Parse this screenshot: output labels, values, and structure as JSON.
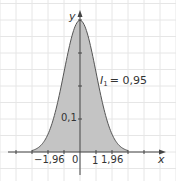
{
  "chart_data": {
    "type": "area",
    "title": "",
    "subtitle": "",
    "xlabel": "x",
    "ylabel": "y",
    "function": "standard normal density f(x) = (1/sqrt(2π)) e^(-x²/2)",
    "x": [
      -3,
      -2.5,
      -2,
      -1.96,
      -1.5,
      -1,
      -0.5,
      0,
      0.5,
      1,
      1.5,
      1.96,
      2,
      2.5,
      3
    ],
    "values": [
      0.004,
      0.018,
      0.054,
      0.058,
      0.13,
      0.242,
      0.352,
      0.399,
      0.352,
      0.242,
      0.13,
      0.058,
      0.054,
      0.018,
      0.004
    ],
    "shaded_interval": [
      -1.96,
      1.96
    ],
    "xlim": [
      -5,
      5.6
    ],
    "ylim": [
      -0.05,
      0.43
    ],
    "x_ticks": [
      -4,
      -3,
      -2,
      -1,
      0,
      1,
      2,
      3,
      4
    ],
    "x_tick_labels": [
      "-1,96",
      "0",
      "1",
      "1,96"
    ],
    "y_ticks": [
      0.1,
      0.2,
      0.3,
      0.4
    ],
    "y_tick_labels": [
      "0,1"
    ],
    "annotation": "I1 = 0,95",
    "grid": true,
    "legend": "none"
  },
  "labels": {
    "y_axis": "y",
    "x_axis": "x",
    "origin": "0",
    "x_one": "1",
    "x_neg_196": "−1,96",
    "x_pos_196": "1,96",
    "y_tick": "0,1",
    "annotation_I": "I",
    "annotation_sub": "1",
    "annotation_value": "= 0,95"
  },
  "colors": {
    "fill": "#c4c4c4",
    "curve": "#555555",
    "axis": "#444444",
    "grid": "#e6e6e6"
  }
}
